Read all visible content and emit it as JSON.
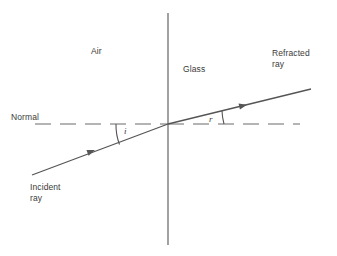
{
  "diagram": {
    "medium_left_label": "Air",
    "medium_right_label": "Glass",
    "normal_label": "Normal",
    "incident_ray_label": "Incident\nray",
    "refracted_ray_label": "Refracted\nray",
    "angle_incidence_label": "i",
    "angle_refraction_label": "r",
    "colors": {
      "line": "#555555",
      "text": "#3a3a3a",
      "background": "#ffffff"
    },
    "geometry": {
      "boundary_x": 168,
      "boundary_y_top": 13,
      "boundary_y_bottom": 245,
      "normal_y": 124,
      "incidence_point_x": 168,
      "incidence_point_y": 124,
      "incident_start_x": 32,
      "incident_start_y": 175,
      "refracted_end_x": 311,
      "refracted_end_y": 89,
      "normal_dash_start_x": 35,
      "normal_dash_end_x": 300
    }
  }
}
